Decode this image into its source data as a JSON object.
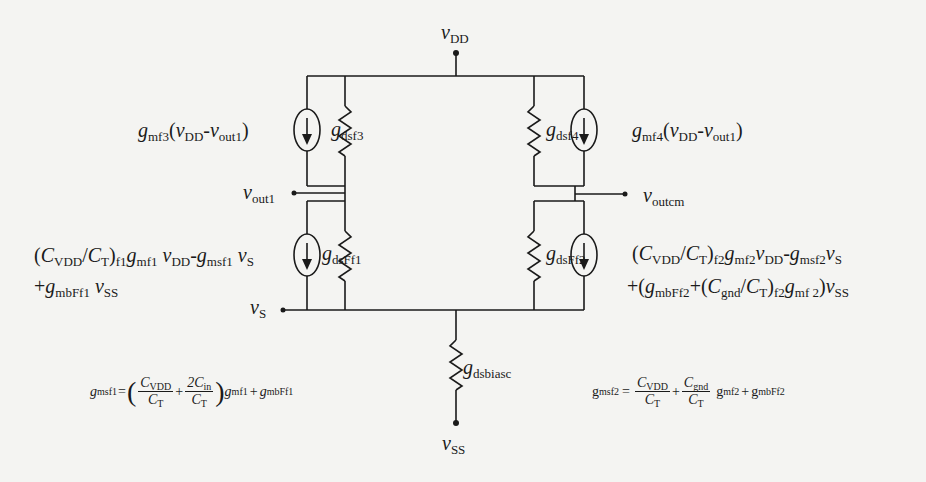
{
  "diagram": {
    "type": "small-signal equivalent circuit",
    "nodes": {
      "vdd": {
        "sym": "v",
        "sub": "DD"
      },
      "vss": {
        "sym": "v",
        "sub": "SS"
      },
      "vout1": {
        "sym": "v",
        "sub": "out1"
      },
      "voutcm": {
        "sym": "v",
        "sub": "outcm"
      },
      "vs": {
        "sym": "v",
        "sub": "S"
      }
    },
    "components": {
      "gdsf3": {
        "sym": "g",
        "sub": "dsf3"
      },
      "gdsf4": {
        "sym": "g",
        "sub": "dsf4"
      },
      "gdsFf1": {
        "sym": "g",
        "sub": "dsFf1"
      },
      "gdsFf2": {
        "sym": "g",
        "sub": "dsFf2"
      },
      "gdsbiasc": {
        "sym": "g",
        "sub": "dsbiasc"
      }
    },
    "sources": {
      "src_f3": {
        "g": "g",
        "g_sub": "mf3",
        "open": "(",
        "v1": "v",
        "v1_sub": "DD",
        "minus": "-",
        "v2": "v",
        "v2_sub": "out1",
        "close": ")"
      },
      "src_f4": {
        "g": "g",
        "g_sub": "mf4",
        "open": "(",
        "v1": "v",
        "v1_sub": "DD",
        "minus": "-",
        "v2": "v",
        "v2_sub": "out1",
        "close": ")"
      },
      "src_ff1": {
        "line1": {
          "open": "(",
          "c1": "C",
          "c1_sub": "VDD",
          "slash": "/",
          "c2": "C",
          "c2_sub": "T",
          "close": ")",
          "close_sub": "f1",
          "g1": "g",
          "g1_sub": "mf1",
          "v1": "v",
          "v1_sub": "DD",
          "minus": "-",
          "g2": "g",
          "g2_sub": "msf1",
          "v2": "v",
          "v2_sub": "S"
        },
        "line2": {
          "plus": "+",
          "g": "g",
          "g_sub": "mbFf1",
          "v": "v",
          "v_sub": "SS"
        }
      },
      "src_ff2": {
        "line1": {
          "open": "(",
          "c1": "C",
          "c1_sub": "VDD",
          "slash": "/",
          "c2": "C",
          "c2_sub": "T",
          "close": ")",
          "close_sub": "f2",
          "g1": "g",
          "g1_sub": "mf2",
          "v1": "v",
          "v1_sub": "DD",
          "minus": "-",
          "g2": "g",
          "g2_sub": "msf2",
          "v2": "v",
          "v2_sub": "S"
        },
        "line2": {
          "plus_open": "+(",
          "g1": "g",
          "g1_sub": "mbFf2",
          "plus": "+",
          "open": "(",
          "c1": "C",
          "c1_sub": "gnd",
          "slash": "/",
          "c2": "C",
          "c2_sub": "T",
          "close": ")",
          "close_sub": "f2",
          "g2": "g",
          "g2_sub": "mf 2",
          "close2": ")",
          "v": "v",
          "v_sub": "SS"
        }
      }
    },
    "equations": {
      "eq_msf1": {
        "lhs": "g",
        "lhs_sub": "msf1",
        "eq": "=",
        "lparen": "(",
        "f1_num": "C",
        "f1_num_sub": "VDD",
        "f1_den": "C",
        "f1_den_sub": "T",
        "plus1": "+",
        "f2_num": "2C",
        "f2_num_sub": "in",
        "f2_den": "C",
        "f2_den_sub": "T",
        "rparen": ")",
        "g1": "g",
        "g1_sub": "mf1",
        "plus2": "+",
        "g2": "g",
        "g2_sub": "mbFf1"
      },
      "eq_msf2": {
        "lhs": "g",
        "lhs_sub": "msf2",
        "eq": "=",
        "f1_num": "C",
        "f1_num_sub": "VDD",
        "f1_den": "C",
        "f1_den_sub": "T",
        "plus1": "+",
        "f2_num": "C",
        "f2_num_sub": "gnd",
        "f2_den": "C",
        "f2_den_sub": "T",
        "g1": "g",
        "g1_sub": "mf2",
        "plus2": "+",
        "g2": "g",
        "g2_sub": "mbFf2"
      }
    },
    "colors": {
      "background": "#f4f4f2",
      "ink": "#1a1a1a"
    }
  }
}
